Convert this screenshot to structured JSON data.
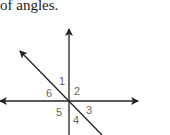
{
  "caption": "of angles.",
  "diagram": {
    "lines": [
      "vertical line with arrow up",
      "horizontal line with arrows both ends",
      "diagonal line from upper-left to lower-right"
    ],
    "angle_labels": [
      "1",
      "2",
      "3",
      "4",
      "5",
      "6"
    ]
  }
}
